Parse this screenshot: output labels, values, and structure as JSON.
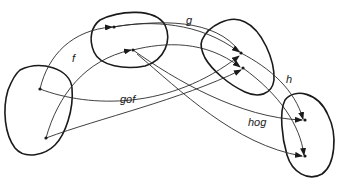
{
  "diagram": {
    "sets": [
      {
        "id": "A",
        "name": "set-a"
      },
      {
        "id": "B",
        "name": "set-b"
      },
      {
        "id": "C",
        "name": "set-c"
      },
      {
        "id": "D",
        "name": "set-d"
      }
    ],
    "labels": {
      "f": "f",
      "g": "g",
      "h": "h",
      "gof": "gof",
      "hog": "hog"
    },
    "mappings": [
      {
        "label": "f",
        "from": "A",
        "to": "B"
      },
      {
        "label": "g",
        "from": "B",
        "to": "C"
      },
      {
        "label": "h",
        "from": "C",
        "to": "D"
      },
      {
        "label": "gof",
        "from": "A",
        "to": "C"
      },
      {
        "label": "hog",
        "from": "B",
        "to": "D"
      }
    ],
    "colors": {
      "ink": "#1a1a1a",
      "background": "#ffffff"
    }
  }
}
